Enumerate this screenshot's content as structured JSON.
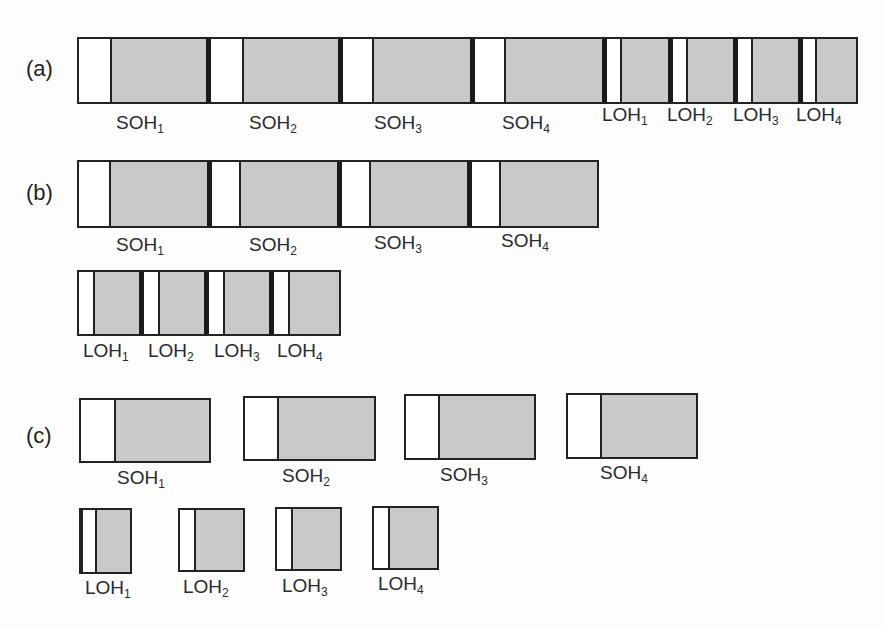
{
  "panels": {
    "a": {
      "label": "(a)",
      "labels": [
        {
          "base": "SOH",
          "sub": "1"
        },
        {
          "base": "SOH",
          "sub": "2"
        },
        {
          "base": "SOH",
          "sub": "3"
        },
        {
          "base": "SOH",
          "sub": "4"
        },
        {
          "base": "LOH",
          "sub": "1"
        },
        {
          "base": "LOH",
          "sub": "2"
        },
        {
          "base": "LOH",
          "sub": "3"
        },
        {
          "base": "LOH",
          "sub": "4"
        }
      ]
    },
    "b": {
      "label": "(b)",
      "soh_labels": [
        {
          "base": "SOH",
          "sub": "1"
        },
        {
          "base": "SOH",
          "sub": "2"
        },
        {
          "base": "SOH",
          "sub": "3"
        },
        {
          "base": "SOH",
          "sub": "4"
        }
      ],
      "loh_labels": [
        {
          "base": "LOH",
          "sub": "1"
        },
        {
          "base": "LOH",
          "sub": "2"
        },
        {
          "base": "LOH",
          "sub": "3"
        },
        {
          "base": "LOH",
          "sub": "4"
        }
      ]
    },
    "c": {
      "label": "(c)",
      "soh_labels": [
        {
          "base": "SOH",
          "sub": "1"
        },
        {
          "base": "SOH",
          "sub": "2"
        },
        {
          "base": "SOH",
          "sub": "3"
        },
        {
          "base": "SOH",
          "sub": "4"
        }
      ],
      "loh_labels": [
        {
          "base": "LOH",
          "sub": "1"
        },
        {
          "base": "LOH",
          "sub": "2"
        },
        {
          "base": "LOH",
          "sub": "3"
        },
        {
          "base": "LOH",
          "sub": "4"
        }
      ]
    }
  },
  "colors": {
    "header_fill": "#ffffff",
    "payload_fill": "#c9c9c9",
    "border": "#222222"
  }
}
